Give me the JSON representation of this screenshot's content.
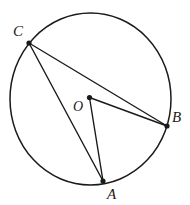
{
  "figure": {
    "kind": "circle-geometry-diagram",
    "background_color": "#ffffff",
    "stroke_color": "#1a1a1a",
    "canvas": {
      "width": 190,
      "height": 205
    },
    "circle": {
      "name": "circle-outline",
      "center_label": "O",
      "cx": 90.5,
      "cy": 99,
      "rx": 80.5,
      "ry": 86,
      "stroke_width": 1.5
    },
    "points": [
      {
        "id": "C",
        "label": "C",
        "x": 29,
        "y": 43,
        "on_circle": true,
        "dot_radius": 2.6
      },
      {
        "id": "B",
        "label": "B",
        "x": 167,
        "y": 126,
        "on_circle": true,
        "dot_radius": 2.6
      },
      {
        "id": "A",
        "label": "A",
        "x": 103,
        "y": 181,
        "on_circle": true,
        "dot_radius": 2.6
      },
      {
        "id": "O",
        "label": "O",
        "x": 89.5,
        "y": 97.5,
        "on_circle": false,
        "dot_radius": 2.6
      }
    ],
    "segments": [
      {
        "id": "CB",
        "name": "chord-c-to-b",
        "from": "C",
        "to": "B",
        "stroke_width": 1.4
      },
      {
        "id": "CA",
        "name": "chord-c-to-a",
        "from": "C",
        "to": "A",
        "stroke_width": 1.4
      },
      {
        "id": "OB",
        "name": "radius-o-to-b",
        "from": "O",
        "to": "B",
        "stroke_width": 1.4
      },
      {
        "id": "OA",
        "name": "radius-o-to-a",
        "from": "O",
        "to": "A",
        "stroke_width": 1.4
      }
    ],
    "labels": {
      "c": "C",
      "b": "B",
      "a": "A",
      "o": "O"
    }
  }
}
